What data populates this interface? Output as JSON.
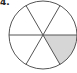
{
  "problem": {
    "label": "4."
  },
  "diagram": {
    "type": "circle-fraction",
    "total_parts": 6,
    "shaded_parts": 1,
    "shaded_sector_index": 0,
    "center": [
      43,
      35
    ],
    "radius": 34,
    "colors": {
      "stroke": "#555555",
      "shade": "#d6d6d6",
      "fill": "#ffffff"
    }
  }
}
